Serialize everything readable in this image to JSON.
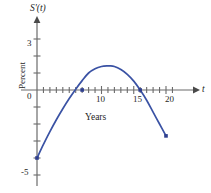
{
  "chart_data": {
    "type": "line",
    "title": "",
    "subtitle": "",
    "xlabel": "Years",
    "ylabel": "Percent",
    "x_axis_variable": "t",
    "y_axis_variable": "S'(t)",
    "xlim": [
      -1.5,
      23
    ],
    "ylim": [
      -6.2,
      4.2
    ],
    "grid": false,
    "legend": null,
    "x_ticks_labeled": [
      {
        "value": 10,
        "label": "10"
      },
      {
        "value": 15,
        "label": "15"
      },
      {
        "value": 20,
        "label": "20"
      }
    ],
    "x_tick_values_all": [
      1,
      2,
      3,
      4,
      5,
      6,
      7,
      8,
      9,
      10,
      11,
      12,
      13,
      14,
      15,
      16,
      17,
      18,
      19,
      20,
      21
    ],
    "y_ticks_labeled": [
      {
        "value": 3,
        "label": "3"
      },
      {
        "value": 0,
        "label": "0"
      },
      {
        "value": -5,
        "label": "-5"
      }
    ],
    "y_tick_values_all": [
      3,
      2,
      1,
      0,
      -1,
      -2,
      -3,
      -4,
      -5
    ],
    "series": [
      {
        "name": "S'(t)",
        "color": "#3a52a4",
        "type": "curve",
        "description": "downward-opening parabola",
        "x": [
          0,
          1,
          2,
          3,
          4,
          5,
          6,
          7,
          8,
          9,
          10,
          11,
          11.3,
          12,
          13,
          14,
          15,
          16,
          17,
          18,
          19,
          20
        ],
        "values": [
          -4.0,
          -3.2,
          -2.45,
          -1.75,
          -1.1,
          -0.5,
          0.05,
          0.55,
          1.0,
          1.25,
          1.38,
          1.42,
          1.42,
          1.38,
          1.2,
          0.92,
          0.52,
          0.0,
          -0.6,
          -1.3,
          -2.0,
          -2.7
        ]
      }
    ],
    "marked_points": [
      {
        "x": 0,
        "y": -4.0,
        "label": "left endpoint"
      },
      {
        "x": 7,
        "y": 0,
        "label": "zero crossing"
      },
      {
        "x": 16,
        "y": 0,
        "label": "zero crossing"
      },
      {
        "x": 20,
        "y": -2.7,
        "label": "right endpoint"
      }
    ],
    "colors": {
      "curve": "#3a52a4",
      "point": "#2f3f8f",
      "axis": "#6b6b6b",
      "text": "#262626"
    }
  }
}
